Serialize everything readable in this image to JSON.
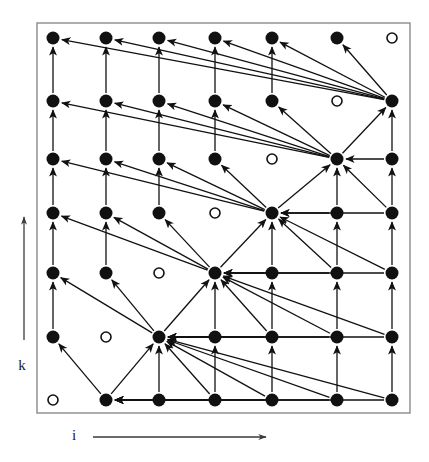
{
  "figure": {
    "background_color": "#ffffff",
    "ink_color": "#111111",
    "frame_color": "#8a8a8a",
    "frame": {
      "x": 37,
      "y": 23,
      "width": 373,
      "height": 390
    }
  },
  "axes": {
    "horizontal": {
      "label": "i",
      "label_x": 74,
      "label_y": 440,
      "arrow": {
        "x1": 93,
        "y1": 437,
        "x2": 266,
        "y2": 437
      }
    },
    "vertical": {
      "label": "k",
      "label_x": 22,
      "label_y": 370,
      "arrow": {
        "x1": 24,
        "y1": 340,
        "x2": 24,
        "y2": 217
      }
    }
  },
  "grid": {
    "columns_x": [
      53,
      106,
      159,
      215,
      272,
      337,
      392
    ],
    "rows_y": [
      38,
      101,
      159,
      213,
      273,
      337,
      400
    ],
    "filled_radius": 6.5,
    "open_radius": 5,
    "open_stroke_width": 1.6,
    "note": "rows_y index 0 is topmost row (largest k); columns_x index 0 is leftmost (smallest i)"
  },
  "nodes": [
    {
      "row": 0,
      "col": 0,
      "type": "filled"
    },
    {
      "row": 0,
      "col": 1,
      "type": "filled"
    },
    {
      "row": 0,
      "col": 2,
      "type": "filled"
    },
    {
      "row": 0,
      "col": 3,
      "type": "filled"
    },
    {
      "row": 0,
      "col": 4,
      "type": "filled"
    },
    {
      "row": 0,
      "col": 5,
      "type": "filled"
    },
    {
      "row": 0,
      "col": 6,
      "type": "open"
    },
    {
      "row": 1,
      "col": 0,
      "type": "filled"
    },
    {
      "row": 1,
      "col": 1,
      "type": "filled"
    },
    {
      "row": 1,
      "col": 2,
      "type": "filled"
    },
    {
      "row": 1,
      "col": 3,
      "type": "filled"
    },
    {
      "row": 1,
      "col": 4,
      "type": "filled"
    },
    {
      "row": 1,
      "col": 5,
      "type": "open"
    },
    {
      "row": 1,
      "col": 6,
      "type": "filled"
    },
    {
      "row": 2,
      "col": 0,
      "type": "filled"
    },
    {
      "row": 2,
      "col": 1,
      "type": "filled"
    },
    {
      "row": 2,
      "col": 2,
      "type": "filled"
    },
    {
      "row": 2,
      "col": 3,
      "type": "filled"
    },
    {
      "row": 2,
      "col": 4,
      "type": "open"
    },
    {
      "row": 2,
      "col": 5,
      "type": "filled"
    },
    {
      "row": 2,
      "col": 6,
      "type": "filled"
    },
    {
      "row": 3,
      "col": 0,
      "type": "filled"
    },
    {
      "row": 3,
      "col": 1,
      "type": "filled"
    },
    {
      "row": 3,
      "col": 2,
      "type": "filled"
    },
    {
      "row": 3,
      "col": 3,
      "type": "open"
    },
    {
      "row": 3,
      "col": 4,
      "type": "filled"
    },
    {
      "row": 3,
      "col": 5,
      "type": "filled"
    },
    {
      "row": 3,
      "col": 6,
      "type": "filled"
    },
    {
      "row": 4,
      "col": 0,
      "type": "filled"
    },
    {
      "row": 4,
      "col": 1,
      "type": "filled"
    },
    {
      "row": 4,
      "col": 2,
      "type": "open"
    },
    {
      "row": 4,
      "col": 3,
      "type": "filled"
    },
    {
      "row": 4,
      "col": 4,
      "type": "filled"
    },
    {
      "row": 4,
      "col": 5,
      "type": "filled"
    },
    {
      "row": 4,
      "col": 6,
      "type": "filled"
    },
    {
      "row": 5,
      "col": 0,
      "type": "filled"
    },
    {
      "row": 5,
      "col": 1,
      "type": "open"
    },
    {
      "row": 5,
      "col": 2,
      "type": "filled"
    },
    {
      "row": 5,
      "col": 3,
      "type": "filled"
    },
    {
      "row": 5,
      "col": 4,
      "type": "filled"
    },
    {
      "row": 5,
      "col": 5,
      "type": "filled"
    },
    {
      "row": 5,
      "col": 6,
      "type": "filled"
    },
    {
      "row": 6,
      "col": 0,
      "type": "open"
    },
    {
      "row": 6,
      "col": 1,
      "type": "filled"
    },
    {
      "row": 6,
      "col": 2,
      "type": "filled"
    },
    {
      "row": 6,
      "col": 3,
      "type": "filled"
    },
    {
      "row": 6,
      "col": 4,
      "type": "filled"
    },
    {
      "row": 6,
      "col": 5,
      "type": "filled"
    },
    {
      "row": 6,
      "col": 6,
      "type": "filled"
    }
  ],
  "hubs": [
    {
      "row": 6,
      "col": 1,
      "fan_left_cols": [
        0
      ],
      "fan_up_row": 5,
      "fan_right_cols": [
        2,
        3,
        4,
        5,
        6
      ]
    },
    {
      "row": 5,
      "col": 2,
      "fan_left_cols": [
        0,
        1
      ],
      "fan_up_row": 4,
      "fan_right_cols": [
        3,
        4,
        5,
        6
      ]
    },
    {
      "row": 4,
      "col": 3,
      "fan_left_cols": [
        0,
        1,
        2
      ],
      "fan_up_row": 3,
      "fan_right_cols": [
        4,
        5,
        6
      ]
    },
    {
      "row": 3,
      "col": 4,
      "fan_left_cols": [
        0,
        1,
        2,
        3
      ],
      "fan_up_row": 2,
      "fan_right_cols": [
        5,
        6
      ]
    },
    {
      "row": 2,
      "col": 5,
      "fan_left_cols": [
        0,
        1,
        2,
        3,
        4
      ],
      "fan_up_row": 1,
      "fan_right_cols": [
        6
      ]
    },
    {
      "row": 1,
      "col": 6,
      "fan_left_cols": [
        0,
        1,
        2,
        3,
        4,
        5
      ],
      "fan_up_row": 0,
      "fan_right_cols": []
    }
  ],
  "vertical_edges_note": "Each column carries short upward arrows between vertically adjacent filled nodes.",
  "arrow_style": {
    "stroke_width": 1.3,
    "head_length": 8,
    "head_width": 5
  }
}
